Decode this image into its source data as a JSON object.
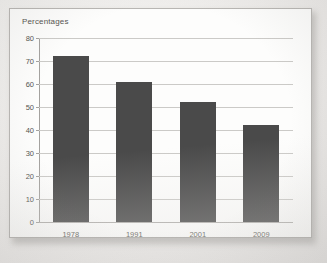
{
  "chart_data": {
    "type": "bar",
    "title": "Percentages",
    "xlabel": "",
    "ylabel": "",
    "categories": [
      "1978",
      "1991",
      "2001",
      "2009"
    ],
    "values": [
      72,
      61,
      52,
      42
    ],
    "ylim": [
      0,
      80
    ],
    "ytick_step": 10,
    "yticks": [
      "80",
      "70",
      "60",
      "50",
      "40",
      "30",
      "20",
      "10",
      "0"
    ],
    "grid": true,
    "legend": "none",
    "bar_color": "#4a4a4a",
    "gridline_color": "#cbcac7",
    "axis_color": "#a4a29f",
    "text_color": "#56554f",
    "background_color": "#fdfdfc",
    "page_color": "#ecebe9"
  }
}
